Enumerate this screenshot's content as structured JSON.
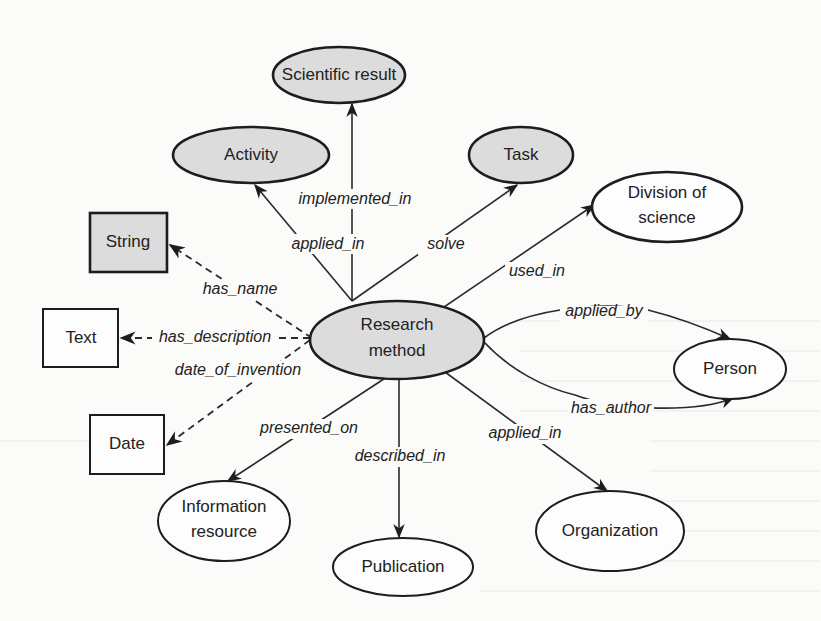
{
  "diagram": {
    "center_node": {
      "id": "research_method",
      "label_line1": "Research",
      "label_line2": "method",
      "shape": "ellipse",
      "fill": "gray"
    },
    "nodes": [
      {
        "id": "scientific_result",
        "label": "Scientific result",
        "shape": "ellipse",
        "fill": "gray"
      },
      {
        "id": "activity",
        "label": "Activity",
        "shape": "ellipse",
        "fill": "gray"
      },
      {
        "id": "task",
        "label": "Task",
        "shape": "ellipse",
        "fill": "gray"
      },
      {
        "id": "division_of_science",
        "label_line1": "Division of",
        "label_line2": "science",
        "shape": "ellipse",
        "fill": "white"
      },
      {
        "id": "string",
        "label": "String",
        "shape": "rectangle",
        "fill": "gray"
      },
      {
        "id": "text",
        "label": "Text",
        "shape": "rectangle",
        "fill": "white"
      },
      {
        "id": "date",
        "label": "Date",
        "shape": "rectangle",
        "fill": "white"
      },
      {
        "id": "person",
        "label": "Person",
        "shape": "ellipse",
        "fill": "white"
      },
      {
        "id": "information_resource",
        "label_line1": "Information",
        "label_line2": "resource",
        "shape": "ellipse",
        "fill": "white"
      },
      {
        "id": "organization",
        "label": "Organization",
        "shape": "ellipse",
        "fill": "white"
      },
      {
        "id": "publication",
        "label": "Publication",
        "shape": "ellipse",
        "fill": "white"
      }
    ],
    "edges": [
      {
        "from": "research_method",
        "to": "scientific_result",
        "label": "implemented_in",
        "style": "solid"
      },
      {
        "from": "research_method",
        "to": "activity",
        "label": "applied_in",
        "style": "solid"
      },
      {
        "from": "research_method",
        "to": "task",
        "label": "solve",
        "style": "solid"
      },
      {
        "from": "research_method",
        "to": "division_of_science",
        "label": "used_in",
        "style": "solid"
      },
      {
        "from": "research_method",
        "to": "string",
        "label": "has_name",
        "style": "dashed"
      },
      {
        "from": "research_method",
        "to": "text",
        "label": "has_description",
        "style": "dashed"
      },
      {
        "from": "research_method",
        "to": "date",
        "label": "date_of_invention",
        "style": "dashed"
      },
      {
        "from": "research_method",
        "to": "person",
        "label": "applied_by",
        "style": "solid"
      },
      {
        "from": "research_method",
        "to": "person",
        "label": "has_author",
        "style": "solid"
      },
      {
        "from": "research_method",
        "to": "information_resource",
        "label": "presented_on",
        "style": "solid"
      },
      {
        "from": "research_method",
        "to": "publication",
        "label": "described_in",
        "style": "solid"
      },
      {
        "from": "research_method",
        "to": "organization",
        "label": "applied_in",
        "style": "solid"
      }
    ],
    "colors": {
      "gray_fill": "#dcdcdc",
      "white_fill": "#fdfdfd",
      "stroke": "#1d1d1d",
      "background": "#fbfbfa"
    }
  }
}
